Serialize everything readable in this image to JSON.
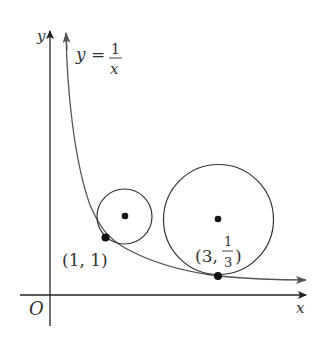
{
  "figure": {
    "axes": {
      "x_label": "x",
      "y_label": "y",
      "origin_label": "O"
    },
    "curve": {
      "equation_lhs": "y =",
      "equation_num": "1",
      "equation_den": "x",
      "color": "#555555"
    },
    "points": [
      {
        "label": "(1, 1)",
        "x": 1,
        "y": 1
      },
      {
        "label_prefix": "(3,",
        "label_num": "1",
        "label_den": "3",
        "label_suffix": ")",
        "x": 3,
        "y": 0.3333
      }
    ],
    "circles": [
      {
        "name": "small-circle",
        "tangent_at": "(1, 1)"
      },
      {
        "name": "large-circle",
        "tangent_at": "(3, 1/3)"
      }
    ]
  }
}
